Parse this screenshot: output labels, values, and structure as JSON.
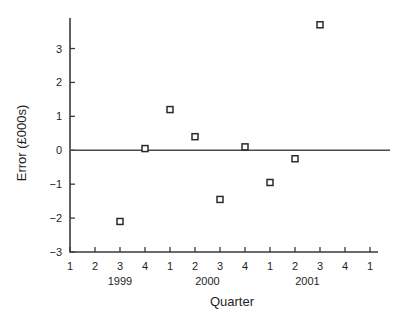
{
  "chart_data": {
    "type": "scatter",
    "title": "",
    "xlabel": "Quarter",
    "ylabel": "Error (£000s)",
    "ylim": [
      -3,
      3.9
    ],
    "yticks": [
      -3,
      -2,
      -1,
      0,
      1,
      2,
      3
    ],
    "ytick_labels": [
      "−3",
      "−2",
      "−1",
      "0",
      "1",
      "2",
      "3"
    ],
    "grid": false,
    "legend": null,
    "zero_line": 0,
    "xtick_labels": [
      "1",
      "2",
      "3",
      "4",
      "1",
      "2",
      "3",
      "4",
      "1",
      "2",
      "3",
      "4",
      "1"
    ],
    "x_group_labels": [
      {
        "label": "1999",
        "at_index": 2
      },
      {
        "label": "2000",
        "at_index": 5.5
      },
      {
        "label": "2001",
        "at_index": 9.5
      }
    ],
    "points": [
      {
        "x_index": 2,
        "quarter": "1999 Q3",
        "y": -2.1
      },
      {
        "x_index": 3,
        "quarter": "1999 Q4",
        "y": 0.05
      },
      {
        "x_index": 4,
        "quarter": "2000 Q1",
        "y": 1.2
      },
      {
        "x_index": 5,
        "quarter": "2000 Q2",
        "y": 0.4
      },
      {
        "x_index": 6,
        "quarter": "2000 Q3",
        "y": -1.45
      },
      {
        "x_index": 7,
        "quarter": "2000 Q4",
        "y": 0.1
      },
      {
        "x_index": 8,
        "quarter": "2001 Q1",
        "y": -0.95
      },
      {
        "x_index": 9,
        "quarter": "2001 Q2",
        "y": -0.25
      },
      {
        "x_index": 10,
        "quarter": "2001 Q3",
        "y": 3.7
      }
    ]
  },
  "colors": {
    "axis": "#3a3a3a",
    "marker_stroke": "#2b2b2b",
    "marker_fill": "#ffffff",
    "text": "#1e1e1e",
    "background": "#ffffff"
  }
}
